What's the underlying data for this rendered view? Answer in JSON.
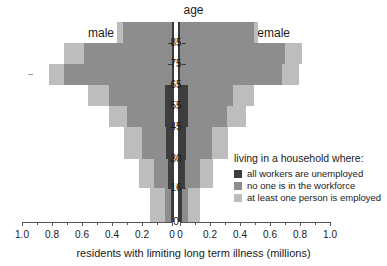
{
  "titles": {
    "age_axis": "age",
    "male": "male",
    "female": "female",
    "xaxis": "residents with limiting long term illness (millions)"
  },
  "legend": {
    "title": "living in a household where:",
    "items": [
      {
        "label": "all workers are unemployed",
        "color": "#3d3d3d",
        "key": "unemployed"
      },
      {
        "label": "no one is in the workforce",
        "color": "#8d8d8d",
        "key": "not_in_workforce"
      },
      {
        "label": "at least one person is employed",
        "color": "#bdbdbd",
        "key": "employed"
      }
    ]
  },
  "axes": {
    "x_ticks_left": [
      "1.0",
      "0.8",
      "0.6",
      "0.4",
      "0.2",
      "0"
    ],
    "x_ticks_right": [
      "0",
      "0.2",
      "0.4",
      "0.6",
      "0.8",
      "1.0"
    ],
    "x_values": [
      1.0,
      0.8,
      0.6,
      0.4,
      0.2,
      0.0
    ],
    "x_min": 0.0,
    "x_max": 1.0,
    "y_ticks": [
      "0",
      "16",
      "30",
      "45",
      "55",
      "65",
      "75",
      "85"
    ],
    "y_tick_values": [
      0,
      16,
      30,
      45,
      55,
      65,
      75,
      85
    ]
  },
  "chart_data": {
    "type": "bar",
    "subtype": "population-pyramid-stacked",
    "title": "",
    "xlabel": "residents with limiting long term illness (millions)",
    "ylabel": "age",
    "xlim": [
      -1.0,
      1.0
    ],
    "grid": false,
    "legend_position": "center-right",
    "categories": [
      "0-16",
      "16-30",
      "30-45",
      "45-55",
      "55-65",
      "65-75",
      "75-85",
      "85+"
    ],
    "band_edges": [
      0,
      16,
      30,
      45,
      55,
      65,
      75,
      85,
      95
    ],
    "sides": [
      "male",
      "female"
    ],
    "series": [
      {
        "name": "all workers are unemployed",
        "color": "#3d3d3d",
        "male": [
          0.01,
          0.03,
          0.04,
          0.05,
          0.05,
          0.0,
          0.0,
          0.0
        ],
        "female": [
          0.01,
          0.03,
          0.04,
          0.05,
          0.05,
          0.0,
          0.0,
          0.0
        ]
      },
      {
        "name": "no one is in the workforce",
        "color": "#8d8d8d",
        "male": [
          0.04,
          0.09,
          0.16,
          0.25,
          0.37,
          0.72,
          0.59,
          0.33
        ],
        "female": [
          0.04,
          0.1,
          0.17,
          0.26,
          0.3,
          0.68,
          0.7,
          0.49
        ]
      },
      {
        "name": "at least one person is employed",
        "color": "#bdbdbd",
        "male": [
          0.1,
          0.1,
          0.12,
          0.12,
          0.14,
          0.1,
          0.13,
          0.04
        ],
        "female": [
          0.08,
          0.09,
          0.11,
          0.13,
          0.14,
          0.11,
          0.11,
          0.03
        ]
      }
    ],
    "totals": {
      "male": [
        0.15,
        0.22,
        0.32,
        0.42,
        0.56,
        0.82,
        0.72,
        0.37
      ],
      "female": [
        0.13,
        0.22,
        0.32,
        0.44,
        0.49,
        0.79,
        0.81,
        0.52
      ]
    },
    "units": "millions of residents"
  }
}
